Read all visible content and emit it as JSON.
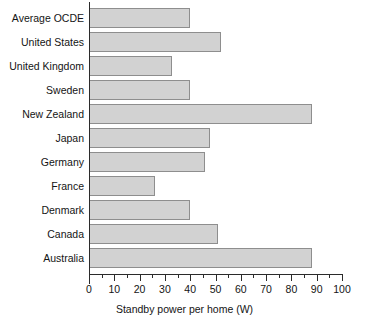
{
  "chart_data": {
    "type": "bar",
    "orientation": "horizontal",
    "title": "",
    "xlabel": "Standby power per home (W)",
    "ylabel": "",
    "xlim": [
      0,
      100
    ],
    "ylim": null,
    "grid": false,
    "legend": null,
    "xticks": [
      0,
      10,
      20,
      30,
      40,
      50,
      60,
      70,
      80,
      90,
      100
    ],
    "xtick_labels": [
      "0",
      "10",
      "20",
      "30",
      "40",
      "50",
      "60",
      "70",
      "80",
      "90",
      "100"
    ],
    "minor_tick_interval": 5,
    "bar_fill_color": "#d2d2d2",
    "bar_edge_color": "#8e8e8e",
    "axis_color": "#2b2b2b",
    "categories": [
      "Average OCDE",
      "United States",
      "United Kingdom",
      "Sweden",
      "New Zealand",
      "Japan",
      "Germany",
      "France",
      "Denmark",
      "Canada",
      "Australia"
    ],
    "values": [
      40,
      52,
      33,
      40,
      88,
      48,
      46,
      26,
      40,
      51,
      88
    ]
  }
}
